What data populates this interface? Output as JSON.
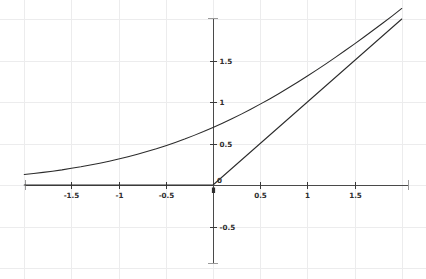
{
  "figure": {
    "title": "",
    "background_color": "#ffffff",
    "width": 426,
    "height": 279
  },
  "axes": {
    "x_axis_label": "",
    "y_axis_label": "",
    "axis_color": "#4a4a4a",
    "grid_color": "#ececed",
    "tick_label_color": "#2e2e2e",
    "x_ticks": [
      {
        "value": -1.5,
        "label": "-1.5"
      },
      {
        "value": -1,
        "label": "-1"
      },
      {
        "value": -0.5,
        "label": "-0.5"
      },
      {
        "value": 0,
        "label": "0"
      },
      {
        "value": 0.5,
        "label": "0.5"
      },
      {
        "value": 1,
        "label": "1"
      },
      {
        "value": 1.5,
        "label": "1.5"
      }
    ],
    "y_ticks": [
      {
        "value": 1.5,
        "label": "1.5"
      },
      {
        "value": 1,
        "label": "1"
      },
      {
        "value": 0.5,
        "label": "0.5"
      },
      {
        "value": 0,
        "label": "0"
      },
      {
        "value": -0.5,
        "label": "-0.5"
      }
    ]
  },
  "chart_data": {
    "type": "line",
    "title": "",
    "subtitle": "",
    "xlabel": "",
    "ylabel": "",
    "xlim": [
      -2.0,
      2.0
    ],
    "ylim": [
      -0.95,
      1.95
    ],
    "grid": true,
    "legend": null,
    "legend_position": "none",
    "annotations": [],
    "x_tick_labels": [
      "-1.5",
      "-1",
      "-0.5",
      "0",
      "0.5",
      "1",
      "1.5"
    ],
    "y_tick_labels": [
      "1.5",
      "1",
      "0.5",
      "0",
      "-0.5"
    ],
    "series": [
      {
        "name": "softplus",
        "formula": "ln(1 + e^x)",
        "color": "#2b2b2b",
        "x": [
          -2.0,
          -1.9,
          -1.8,
          -1.7,
          -1.6,
          -1.5,
          -1.4,
          -1.3,
          -1.2,
          -1.1,
          -1.0,
          -0.9,
          -0.8,
          -0.7,
          -0.6,
          -0.5,
          -0.4,
          -0.3,
          -0.2,
          -0.1,
          0.0,
          0.1,
          0.2,
          0.3,
          0.4,
          0.5,
          0.6,
          0.7,
          0.8,
          0.9,
          1.0,
          1.1,
          1.2,
          1.3,
          1.4,
          1.5,
          1.6,
          1.7,
          1.8,
          1.9,
          2.0
        ],
        "values": [
          0.127,
          0.139,
          0.152,
          0.166,
          0.182,
          0.201,
          0.219,
          0.241,
          0.263,
          0.287,
          0.313,
          0.341,
          0.371,
          0.403,
          0.437,
          0.474,
          0.513,
          0.554,
          0.598,
          0.644,
          0.693,
          0.744,
          0.798,
          0.854,
          0.913,
          0.974,
          1.037,
          1.103,
          1.171,
          1.241,
          1.313,
          1.387,
          1.463,
          1.54,
          1.62,
          1.701,
          1.783,
          1.867,
          1.952,
          2.038,
          2.127
        ]
      },
      {
        "name": "relu",
        "formula": "max(0, x)",
        "color": "#2b2b2b",
        "x": [
          -2.0,
          -1.5,
          -1.0,
          -0.5,
          0.0,
          0.5,
          1.0,
          1.5,
          2.0
        ],
        "values": [
          0.0,
          0.0,
          0.0,
          0.0,
          0.0,
          0.5,
          1.0,
          1.5,
          2.0
        ]
      }
    ]
  }
}
